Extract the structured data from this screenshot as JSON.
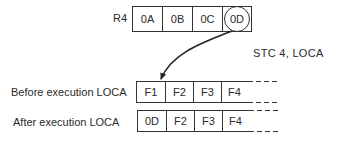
{
  "register": {
    "label": "R4",
    "bytes": [
      "0A",
      "0B",
      "0C",
      "0D"
    ],
    "highlighted_index": 3
  },
  "instruction": {
    "text": "STC 4,  LOCA"
  },
  "memory_before": {
    "label": "Before execution  LOCA",
    "bytes": [
      "F1",
      "F2",
      "F3",
      "F4"
    ]
  },
  "memory_after": {
    "label": "After execution  LOCA",
    "bytes": [
      "0D",
      "F2",
      "F3",
      "F4"
    ]
  },
  "colors": {
    "line": "#333333",
    "text": "#2a2a2a",
    "background": "#ffffff"
  }
}
